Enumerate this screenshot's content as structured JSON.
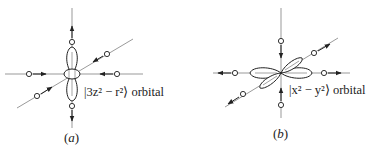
{
  "figure": {
    "panels": [
      {
        "id": "a",
        "caption": "a",
        "orbital_label": "|3z² − r²⟩ orbital",
        "orbital": "3z^2 - r^2",
        "ligand_motion": {
          "z_axis": "outward",
          "x_axis": "inward",
          "y_axis": "inward"
        }
      },
      {
        "id": "b",
        "caption": "b",
        "orbital_label": "|x² − y²⟩ orbital",
        "orbital": "x^2 - y^2",
        "ligand_motion": {
          "z_axis": "inward",
          "x_axis": "outward",
          "y_axis": "outward"
        }
      }
    ],
    "colors": {
      "line": "#222222",
      "axis": "#555555",
      "background": "#ffffff"
    }
  }
}
